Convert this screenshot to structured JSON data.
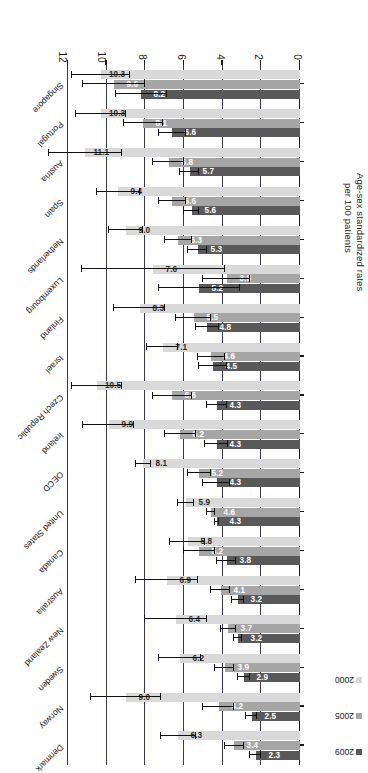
{
  "chart_data": {
    "type": "bar",
    "orientation": "horizontal",
    "title": "",
    "xlabel": "Age-sex standardized rates per 100 patients",
    "ylabel": "",
    "xlim": [
      0,
      12
    ],
    "xticks": [
      "0",
      "2",
      "4",
      "6",
      "8",
      "10",
      "12"
    ],
    "grid": true,
    "legend_position": "top-left",
    "categories": [
      "Denmark",
      "Norway",
      "Sweden",
      "New Zealand",
      "Australia",
      "Canada",
      "United States",
      "OECD",
      "Ireland",
      "Czech Republic",
      "Israel",
      "Finland",
      "Luxembourg",
      "Netherlands",
      "Spain",
      "Austria",
      "Portugal",
      "Singapore"
    ],
    "series": [
      {
        "name": "2000",
        "color": "#d9d9d9",
        "values": [
          6.3,
          9.0,
          6.2,
          6.4,
          6.9,
          5.8,
          5.9,
          8.1,
          9.9,
          10.5,
          7.1,
          8.3,
          7.6,
          9.0,
          9.4,
          11.1,
          10.3,
          10.3
        ],
        "err_low": [
          5.4,
          7.2,
          5.1,
          4.8,
          5.3,
          4.9,
          5.5,
          7.7,
          8.6,
          9.2,
          6.3,
          7.0,
          3.9,
          8.1,
          8.3,
          9.2,
          9.0,
          8.8
        ],
        "err_high": [
          7.2,
          10.8,
          7.3,
          8.0,
          8.5,
          6.7,
          6.3,
          8.5,
          11.2,
          11.8,
          7.9,
          9.6,
          11.3,
          9.9,
          10.5,
          13.0,
          11.6,
          11.8
        ]
      },
      {
        "name": "2005",
        "color": "#a6a6a6",
        "values": [
          3.4,
          4.2,
          3.9,
          3.7,
          4.1,
          5.2,
          4.6,
          5.2,
          6.2,
          6.6,
          4.6,
          5.5,
          3.8,
          6.3,
          6.6,
          6.8,
          8.1,
          9.6
        ],
        "err_low": [
          2.9,
          3.4,
          3.4,
          3.3,
          3.6,
          4.4,
          4.4,
          4.6,
          5.4,
          5.6,
          3.9,
          4.6,
          2.6,
          5.6,
          5.9,
          6.0,
          7.1,
          8.0
        ],
        "err_high": [
          3.9,
          5.0,
          4.4,
          4.1,
          4.6,
          6.0,
          4.8,
          5.8,
          7.0,
          7.6,
          5.3,
          6.4,
          5.0,
          7.0,
          7.3,
          7.6,
          9.1,
          11.2
        ]
      },
      {
        "name": "2009",
        "color": "#595959",
        "values": [
          2.3,
          2.5,
          2.9,
          3.2,
          3.2,
          3.8,
          4.3,
          4.3,
          4.3,
          4.3,
          4.5,
          4.8,
          5.2,
          5.3,
          5.6,
          5.7,
          6.6,
          8.2
        ],
        "err_low": [
          2.0,
          2.2,
          2.6,
          3.0,
          2.9,
          3.3,
          4.2,
          3.6,
          3.7,
          3.8,
          3.8,
          4.2,
          3.1,
          4.8,
          5.2,
          5.2,
          5.9,
          6.9
        ],
        "err_high": [
          2.6,
          2.8,
          3.2,
          3.4,
          3.5,
          4.3,
          4.4,
          5.0,
          4.9,
          4.8,
          5.2,
          5.4,
          7.3,
          5.8,
          6.0,
          6.2,
          7.3,
          9.5
        ]
      }
    ]
  },
  "legend": {
    "items": [
      {
        "label": "2009",
        "color": "#595959"
      },
      {
        "label": "2005",
        "color": "#a6a6a6"
      },
      {
        "label": "2000",
        "color": "#d9d9d9"
      }
    ]
  },
  "axis_title": {
    "line1": "Age-sex standardized rates",
    "line2": "per 100 patients"
  }
}
